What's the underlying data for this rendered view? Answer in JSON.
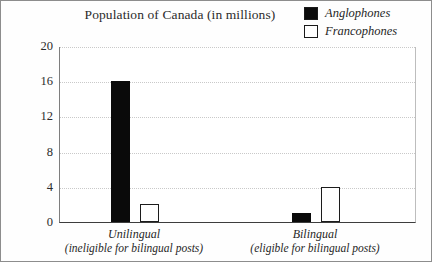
{
  "chart_data": {
    "type": "bar",
    "title": "Population of Canada (in millions)",
    "xlabel": "",
    "ylabel": "",
    "ylim": [
      0,
      20
    ],
    "yticks": [
      0,
      4,
      8,
      12,
      16,
      20
    ],
    "grid": true,
    "legend_position": "top-right",
    "categories": [
      "Unilingual (ineligible for bilingual posts)",
      "Bilingual (eligible for bilingual posts)"
    ],
    "category_lines": [
      {
        "main": "Unilingual",
        "sub": "(ineligible for bilingual posts)"
      },
      {
        "main": "Bilingual",
        "sub": "(eligible for bilingual posts)"
      }
    ],
    "series": [
      {
        "name": "Anglophones",
        "color": "#0a0a0a",
        "fill": "solid",
        "values": [
          16,
          1
        ]
      },
      {
        "name": "Francophones",
        "color": "#ffffff",
        "fill": "hollow",
        "values": [
          2,
          4
        ]
      }
    ]
  },
  "legend": {
    "items": [
      {
        "label": "Anglophones",
        "swatch": "filled-square-icon"
      },
      {
        "label": "Francophones",
        "swatch": "hollow-square-icon"
      }
    ]
  },
  "axis": {
    "y_ticks": [
      "0",
      "4",
      "8",
      "12",
      "16",
      "20"
    ]
  }
}
